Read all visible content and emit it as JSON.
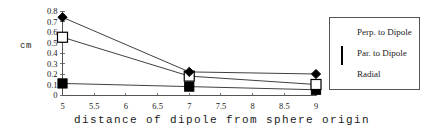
{
  "chart_data": {
    "type": "line",
    "title": "",
    "xlabel": "distance of dipole from sphere origin",
    "ylabel": "cm",
    "x": [
      5,
      7,
      9
    ],
    "xlim": [
      5,
      9
    ],
    "ylim": [
      0,
      0.8
    ],
    "xticks": [
      "5",
      "5.5",
      "6",
      "6.5",
      "7",
      "7.5",
      "8",
      "8.5",
      "9"
    ],
    "xtick_values": [
      5,
      5.5,
      6,
      6.5,
      7,
      7.5,
      8,
      8.5,
      9
    ],
    "yticks": [
      "0",
      "0.1",
      "0.2",
      "0.3",
      "0.4",
      "0.5",
      "0.6",
      "0.7",
      "0.8"
    ],
    "ytick_values": [
      0,
      0.1,
      0.2,
      0.3,
      0.4,
      0.5,
      0.6,
      0.7,
      0.8
    ],
    "grid": false,
    "legend_position": "right",
    "series": [
      {
        "name": "Perp. to Dipole",
        "marker": "filled-square",
        "color": "#000000",
        "values": [
          0.11,
          0.08,
          0.05
        ]
      },
      {
        "name": "Par. to Dipole",
        "marker": "open-square",
        "color": "#000000",
        "values": [
          0.55,
          0.18,
          0.1
        ]
      },
      {
        "name": "Radial",
        "marker": "diamond",
        "color": "#000000",
        "values": [
          0.74,
          0.22,
          0.2
        ]
      }
    ]
  },
  "axis": {
    "y_title": "cm",
    "x_title": "distance of dipole from sphere origin"
  },
  "legend": {
    "entries": [
      {
        "label": "Perp. to Dipole",
        "marker": "filled-square"
      },
      {
        "label": "Par. to Dipole",
        "marker": "open-square"
      },
      {
        "label": "Radial",
        "marker": "diamond"
      }
    ]
  }
}
